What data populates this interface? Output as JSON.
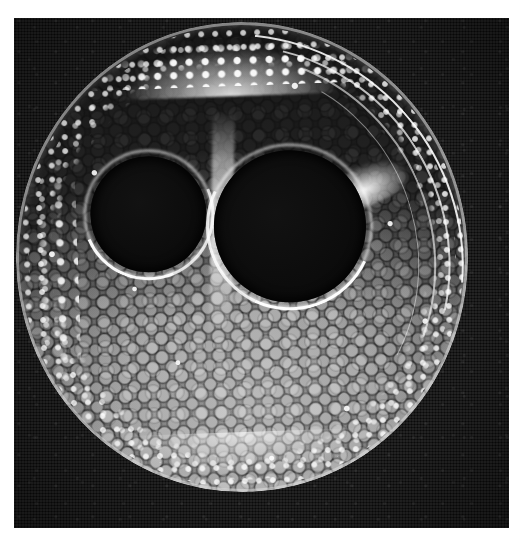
{
  "figure": {
    "kind": "grayscale-micrograph",
    "modality": "Micro-CT / light microscopy cross-section",
    "alt_text": "Grayscale circular cross-section of a plant stem showing two large dark air lacunae near the centre-top, a bright speckled epidermal rim, concentric sclerenchyma arcs on the right, and honeycomb parenchyma cell texture filling the lower half.",
    "background_color": "#0c0c0c",
    "page_color": "#ffffff",
    "highlight_color": "#ffffff",
    "tissue_color": "#7e7e7e",
    "lacuna_color": "#0c0c0c"
  },
  "frame": {
    "x": 14,
    "y": 18,
    "width": 495,
    "height": 510
  },
  "specimen": {
    "label": "culm-cross-section",
    "center_x": 242,
    "center_y": 257,
    "radius_x": 226,
    "radius_y": 235,
    "rotation_deg": -2
  },
  "features": [
    {
      "name": "left-lacuna",
      "cx": 150,
      "cy": 211,
      "r": 58,
      "tone": "black"
    },
    {
      "name": "right-lacuna",
      "cx": 291,
      "cy": 228,
      "r": 76,
      "tone": "black"
    },
    {
      "name": "epidermis-rim",
      "tone": "bright-speckled"
    },
    {
      "name": "sclerenchyma-arcs",
      "tone": "bright",
      "count": 4,
      "side": "upper-right"
    },
    {
      "name": "parenchyma-cells",
      "tone": "mid-gray",
      "cell_size_px": 19,
      "region": "lower-half"
    },
    {
      "name": "septum",
      "tone": "bright",
      "region": "between-lacunae"
    },
    {
      "name": "top-crest",
      "tone": "very-bright",
      "region": "top-arc"
    }
  ],
  "annotations": {
    "has_scale_bar": false,
    "has_text_labels": false,
    "has_arrows": false
  }
}
